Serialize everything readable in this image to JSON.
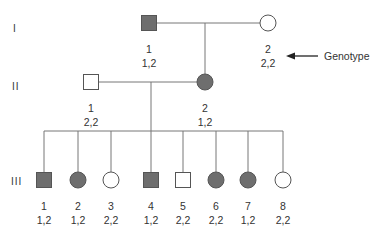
{
  "colors": {
    "affected_fill": "#6e6e6e",
    "unaffected_fill": "#ffffff",
    "stroke": "#555555",
    "line": "#777777",
    "arrow": "#222222"
  },
  "generations": [
    {
      "label": "I",
      "x": 13,
      "y": 23
    },
    {
      "label": "II",
      "x": 12,
      "y": 81
    },
    {
      "label": "III",
      "x": 11,
      "y": 176
    }
  ],
  "individuals": [
    {
      "gen": "I",
      "id": "1",
      "genotype": "1,2",
      "sex": "male",
      "affected": true,
      "cx": 149,
      "cy": 23
    },
    {
      "gen": "I",
      "id": "2",
      "genotype": "2,2",
      "sex": "female",
      "affected": false,
      "cx": 268,
      "cy": 23
    },
    {
      "gen": "II",
      "id": "1",
      "genotype": "2,2",
      "sex": "male",
      "affected": false,
      "cx": 91,
      "cy": 82
    },
    {
      "gen": "II",
      "id": "2",
      "genotype": "1,2",
      "sex": "female",
      "affected": true,
      "cx": 205,
      "cy": 82
    },
    {
      "gen": "III",
      "id": "1",
      "genotype": "1,2",
      "sex": "male",
      "affected": true,
      "cx": 44,
      "cy": 180
    },
    {
      "gen": "III",
      "id": "2",
      "genotype": "1,2",
      "sex": "female",
      "affected": true,
      "cx": 78,
      "cy": 180
    },
    {
      "gen": "III",
      "id": "3",
      "genotype": "2,2",
      "sex": "female",
      "affected": false,
      "cx": 111,
      "cy": 180
    },
    {
      "gen": "III",
      "id": "4",
      "genotype": "1,2",
      "sex": "male",
      "affected": true,
      "cx": 151,
      "cy": 180
    },
    {
      "gen": "III",
      "id": "5",
      "genotype": "2,2",
      "sex": "male",
      "affected": false,
      "cx": 183,
      "cy": 180
    },
    {
      "gen": "III",
      "id": "6",
      "genotype": "2,2",
      "sex": "female",
      "affected": true,
      "cx": 216,
      "cy": 180
    },
    {
      "gen": "III",
      "id": "7",
      "genotype": "1,2",
      "sex": "female",
      "affected": true,
      "cx": 248,
      "cy": 180
    },
    {
      "gen": "III",
      "id": "8",
      "genotype": "2,2",
      "sex": "female",
      "affected": false,
      "cx": 283,
      "cy": 180
    }
  ],
  "lines": [
    {
      "name": "mating-line-gen-I",
      "x1": 157,
      "y1": 23,
      "x2": 260,
      "y2": 23
    },
    {
      "name": "descent-line-gen-I",
      "x1": 205,
      "y1": 23,
      "x2": 205,
      "y2": 74
    },
    {
      "name": "mating-line-gen-II",
      "x1": 99,
      "y1": 82,
      "x2": 197,
      "y2": 82
    },
    {
      "name": "descent-line-gen-II",
      "x1": 151,
      "y1": 82,
      "x2": 151,
      "y2": 131
    },
    {
      "name": "sibship-line-gen-III",
      "x1": 44,
      "y1": 131,
      "x2": 283,
      "y2": 131
    }
  ],
  "legend": {
    "label": "Genotype",
    "arrow": {
      "x1": 318,
      "y1": 56,
      "x2": 286,
      "y2": 56
    },
    "text_x": 324,
    "text_y": 50
  }
}
